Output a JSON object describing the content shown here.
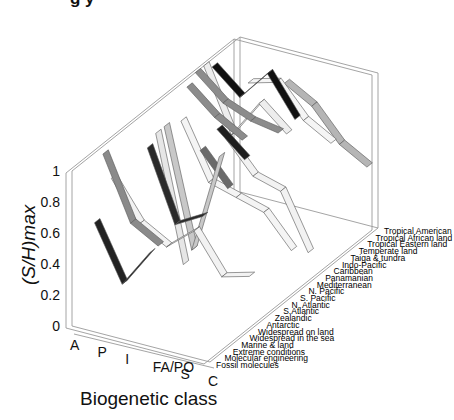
{
  "chart_data": {
    "type": "ribbon3d",
    "title": "",
    "xlabel": "Biogenetic class",
    "ylabel": "(S/H)max",
    "zlabel": "",
    "x_categories": [
      "A",
      "P",
      "I",
      "FA/PO",
      "S",
      "C"
    ],
    "y_categories": [
      "Fossil molecules",
      "Molecular engineering",
      "Extreme conditions",
      "Marine & land",
      "Widespread in the sea",
      "Widespread on land",
      "Antarctic",
      "Zealandic",
      "S.Atlantic",
      "N. Atlantic",
      "S. Pacific",
      "N. Pacific",
      "Mediterranean",
      "Panamanian",
      "Caribbean",
      "Indo-Pacific",
      "Taiga & tundra",
      "Temperate land",
      "Tropical Eastern land",
      "Tropical African land",
      "Tropical American"
    ],
    "zlim": [
      0,
      1
    ],
    "z_ticks": [
      "0",
      "0.2",
      "0.4",
      "0.6",
      "0.8",
      "1"
    ],
    "series": [
      {
        "name": "Marine & land",
        "shade": "#222222",
        "values": [
          0.55,
          0.2,
          0.45,
          null,
          null,
          null
        ]
      },
      {
        "name": "Widespread in the sea",
        "shade": "#8a8a8a",
        "values": [
          0.95,
          0.55,
          0.45,
          null,
          null,
          null
        ]
      },
      {
        "name": "Widespread on land",
        "shade": "#f2f2f2",
        "values": [
          0.75,
          0.5,
          0.4,
          0.55,
          0.3,
          0.35
        ]
      },
      {
        "name": "Antarctic",
        "shade": "#2a2a2a",
        "values": [
          null,
          0.95,
          0.5,
          0.6,
          null,
          null
        ]
      },
      {
        "name": "Zealandic",
        "shade": "#e6e6e6",
        "values": [
          null,
          1.0,
          0.2,
          null,
          null,
          null
        ]
      },
      {
        "name": "S.Atlantic",
        "shade": "#c8c8c8",
        "values": [
          null,
          1.0,
          0.25,
          0.9,
          null,
          null
        ]
      },
      {
        "name": "N. Atlantic",
        "shade": "#6a6a6a",
        "values": [
          null,
          null,
          0.85,
          0.65,
          null,
          null
        ]
      },
      {
        "name": "S. Pacific",
        "shade": "#f4f4f4",
        "values": [
          null,
          0.95,
          0.6,
          0.55,
          0.5,
          0.3
        ]
      },
      {
        "name": "N. Pacific",
        "shade": "#1e1e1e",
        "values": [
          null,
          null,
          0.9,
          0.75,
          null,
          null
        ]
      },
      {
        "name": "Mediterranean",
        "shade": "#f2f2f2",
        "values": [
          null,
          null,
          0.8,
          0.6,
          0.55,
          0.2
        ]
      },
      {
        "name": "Caribbean",
        "shade": "#8c8c8c",
        "values": [
          0.95,
          0.8,
          0.7,
          null,
          null,
          null
        ]
      },
      {
        "name": "Indo-Pacific",
        "shade": "#8c8c8c",
        "values": [
          1.0,
          0.85,
          0.78,
          0.75,
          null,
          null
        ]
      },
      {
        "name": "Taiga & tundra",
        "shade": "#ededed",
        "values": [
          1.0,
          0.6,
          0.85,
          0.7,
          null,
          null
        ]
      },
      {
        "name": "Temperate land",
        "shade": "#111111",
        "values": [
          0.95,
          0.8,
          1.0,
          0.75,
          null,
          null
        ]
      },
      {
        "name": "Tropical Eastern land",
        "shade": "#f5f5f5",
        "values": [
          null,
          0.85,
          0.9,
          0.7,
          0.6,
          null
        ]
      },
      {
        "name": "Tropical African land",
        "shade": "#b5b5b5",
        "values": [
          null,
          null,
          0.85,
          0.75,
          0.55,
          0.45
        ]
      }
    ],
    "grid": false,
    "legend": "none"
  },
  "labels": {
    "title_partial": "",
    "ylabel": "(S/H)max",
    "xlabel": "Biogenetic class"
  }
}
